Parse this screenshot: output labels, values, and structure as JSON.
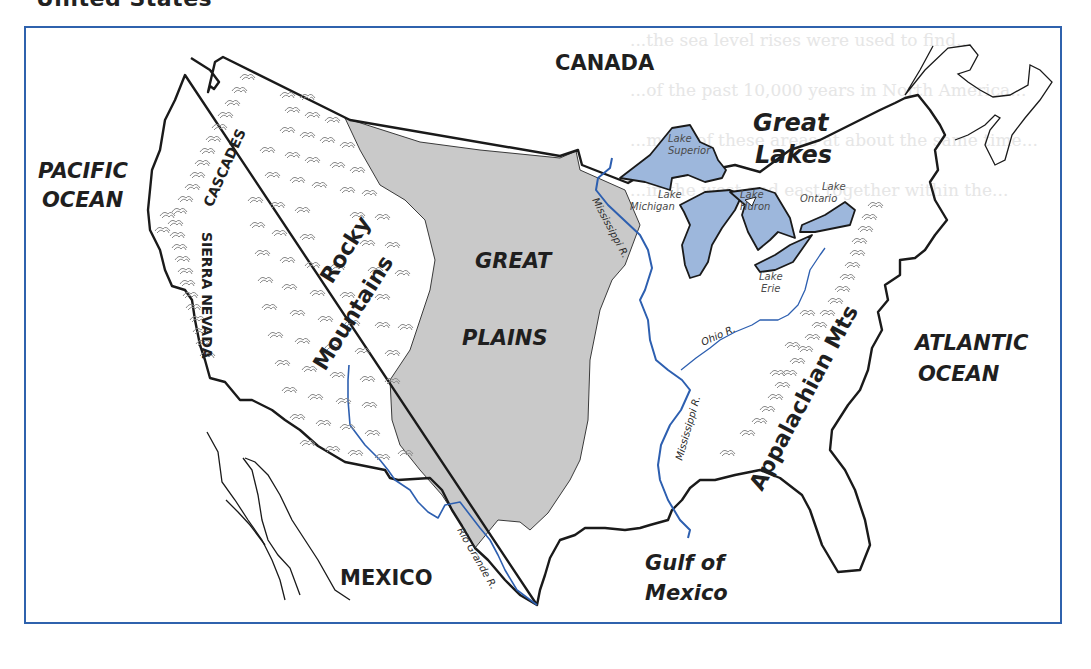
{
  "page": {
    "heading": "United States",
    "background_text_lines": [
      "...the sea level rises were used to find...",
      "...of the past 10,000 years in North America...",
      "...more of these areas at about the same time...",
      "...in the west and east together within the..."
    ]
  },
  "map": {
    "frame_color": "#2f62ad",
    "colors": {
      "land_outline": "#1a1a1a",
      "great_plains_fill": "#c9c9c9",
      "lake_fill": "#9db7dc",
      "river": "#2d5fb0",
      "mountain_symbol": "#8a8a8a"
    },
    "labels": {
      "countries": {
        "canada": "CANADA",
        "mexico": "MEXICO"
      },
      "oceans": {
        "pacific_line1": "PACIFIC",
        "pacific_line2": "OCEAN",
        "atlantic_line1": "ATLANTIC",
        "atlantic_line2": "OCEAN",
        "gulf_line1": "Gulf of",
        "gulf_line2": "Mexico"
      },
      "regions": {
        "great_plains_line1": "GREAT",
        "great_plains_line2": "PLAINS",
        "great_lakes_line1": "Great",
        "great_lakes_line2": "Lakes"
      },
      "mountains": {
        "cascades": "CASCADES",
        "sierra_nevada": "SIERRA NEVADA",
        "rocky_line1": "Rocky",
        "rocky_line2": "Mountains",
        "appalachian": "Appalachian Mts"
      },
      "lakes": {
        "superior_line1": "Lake",
        "superior_line2": "Superior",
        "michigan_line1": "Lake",
        "michigan_line2": "Michigan",
        "huron_line1": "Lake",
        "huron_line2": "Huron",
        "ontario_line1": "Lake",
        "ontario_line2": "Ontario",
        "erie_line1": "Lake",
        "erie_line2": "Erie"
      },
      "rivers": {
        "mississippi_upper": "Mississippi R.",
        "mississippi_lower": "Mississippi R.",
        "ohio": "Ohio R.",
        "rio_grande": "Rio Grande R."
      }
    }
  }
}
